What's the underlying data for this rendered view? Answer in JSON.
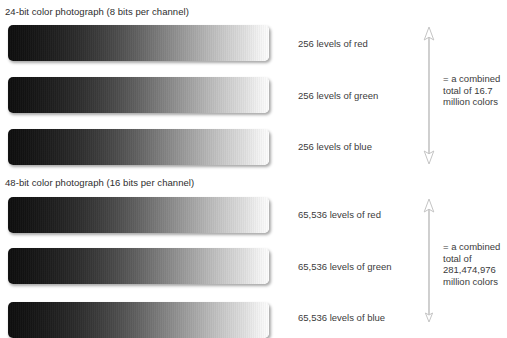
{
  "page": {
    "background": "#ffffff",
    "text_color": "#3b3b3b",
    "arrow_color": "#c9c9c9"
  },
  "sections": [
    {
      "title": "24-bit color photograph (8 bits per channel)",
      "channels": [
        {
          "label": "256 levels of red",
          "name": "red"
        },
        {
          "label": "256 levels of green",
          "name": "green"
        },
        {
          "label": "256 levels of blue",
          "name": "blue"
        }
      ],
      "summary": [
        "= a combined",
        "total of 16.7",
        "million colors"
      ]
    },
    {
      "title": "48-bit color photograph (16 bits per channel)",
      "channels": [
        {
          "label": "65,536 levels of red",
          "name": "red"
        },
        {
          "label": "65,536 levels of green",
          "name": "green"
        },
        {
          "label": "65,536 levels of blue",
          "name": "blue"
        }
      ],
      "summary": [
        "= a combined",
        "total of",
        "281,474,976",
        "million colors"
      ]
    }
  ],
  "gradient": {
    "from": "#0d0d0d",
    "to": "#fdfdfd",
    "description": "black to white tonal ramp"
  }
}
